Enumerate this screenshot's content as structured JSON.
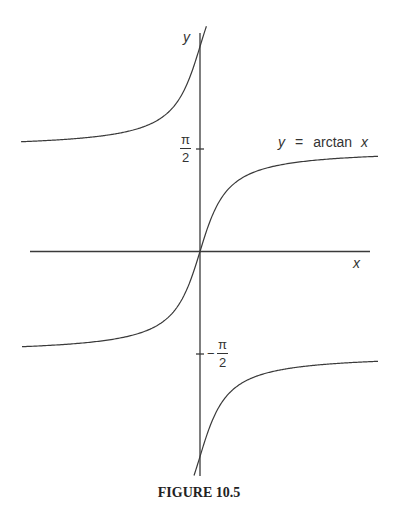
{
  "chart_data": {
    "type": "line",
    "title": "FIGURE 10.5",
    "xlabel": "x",
    "ylabel": "y",
    "annotation": "y = arctan x",
    "grid": false,
    "legend": null,
    "yticks": [
      {
        "value": 1.5708,
        "label_num": "π",
        "label_den": "2",
        "sign": ""
      },
      {
        "value": -1.5708,
        "label_num": "π",
        "label_den": "2",
        "sign": "−"
      }
    ],
    "xlim": [
      -8.5,
      8.5
    ],
    "ylim": [
      -2.2,
      2.4
    ],
    "series": [
      {
        "name": "arctan x (principal branch)",
        "function": "atan(x)",
        "x": [
          -8.9,
          -4,
          -2,
          -1,
          0,
          1,
          2,
          4,
          8.9
        ],
        "y": [
          -1.459,
          -1.326,
          -1.107,
          -0.785,
          0,
          0.785,
          1.107,
          1.326,
          1.459
        ]
      },
      {
        "name": "arctan x + π (upper-left branch)",
        "function": "atan(x)+pi",
        "x": [
          -8.9,
          -4,
          -2,
          -1,
          -0.3
        ],
        "y": [
          1.683,
          1.816,
          2.034,
          2.356,
          2.85
        ]
      },
      {
        "name": "arctan x − π (lower-right branch)",
        "function": "atan(x)-pi",
        "x": [
          0.3,
          1,
          2,
          4,
          8.9
        ],
        "y": [
          -2.85,
          -2.356,
          -2.034,
          -1.816,
          -1.683
        ]
      }
    ]
  },
  "labels": {
    "y_axis": "y",
    "x_axis": "x",
    "equation_y": "y",
    "equation_eq": "=",
    "equation_fn": "arctan",
    "equation_x": "x",
    "tick_pos_num": "π",
    "tick_pos_den": "2",
    "tick_neg_sign": "−",
    "tick_neg_num": "π",
    "tick_neg_den": "2",
    "caption": "FIGURE 10.5"
  }
}
